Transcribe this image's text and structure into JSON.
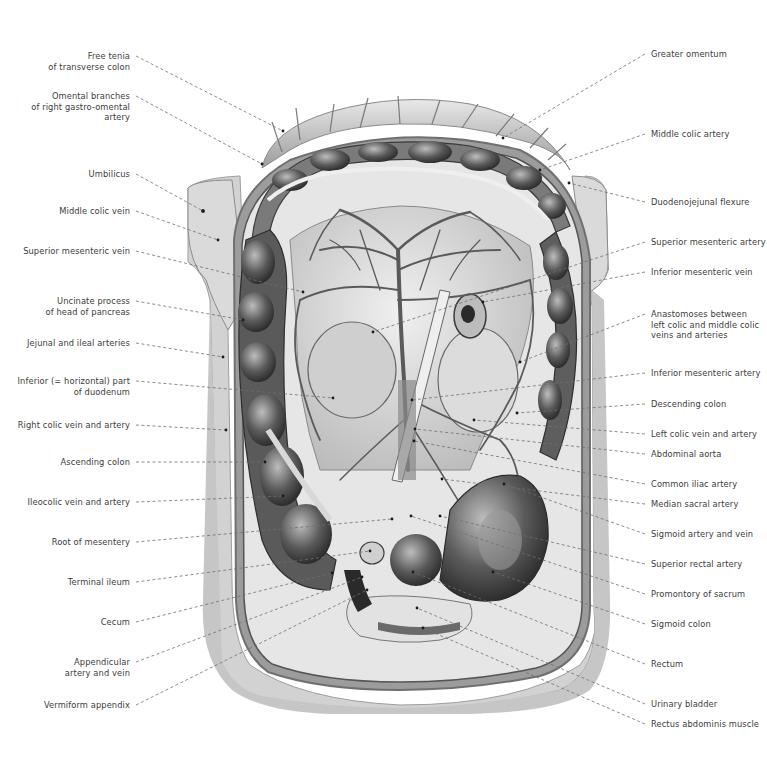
{
  "figure": {
    "colors": {
      "background": "#ffffff",
      "skin": "#c9c9c9",
      "skin_dark": "#a9a9a9",
      "tissue_light": "#dcdcdc",
      "tissue_mid": "#8c8c8c",
      "tissue_dark": "#3d3d3d",
      "leader_line": "#6e6e6e",
      "label_text": "#3c3c3c"
    }
  },
  "labels_left": [
    {
      "id": "free-tenia",
      "text": "Free tenia\nof transverse colon",
      "x": 130,
      "y": 56,
      "target": [
        283,
        131
      ]
    },
    {
      "id": "omental-branches",
      "text": "Omental branches\nof right gastro-omental\nartery",
      "x": 130,
      "y": 96,
      "target": [
        262,
        164
      ]
    },
    {
      "id": "umbilicus",
      "text": "Umbilicus",
      "x": 130,
      "y": 174,
      "target": [
        203,
        211
      ]
    },
    {
      "id": "middle-colic-vein",
      "text": "Middle colic vein",
      "x": 130,
      "y": 211,
      "target": [
        218,
        240
      ]
    },
    {
      "id": "superior-mesenteric-vein",
      "text": "Superior mesenteric vein",
      "x": 130,
      "y": 251,
      "target": [
        303,
        292
      ]
    },
    {
      "id": "uncinate-process",
      "text": "Uncinate process\nof head of pancreas",
      "x": 130,
      "y": 301,
      "target": [
        243,
        320
      ]
    },
    {
      "id": "jejunal-ileal-arteries",
      "text": "Jejunal and ileal arteries",
      "x": 130,
      "y": 343,
      "target": [
        223,
        357
      ]
    },
    {
      "id": "inferior-duodenum",
      "text": "Inferior (= horizontal) part\nof duodenum",
      "x": 130,
      "y": 381,
      "target": [
        333,
        398
      ]
    },
    {
      "id": "right-colic",
      "text": "Right colic vein and artery",
      "x": 130,
      "y": 425,
      "target": [
        226,
        430
      ]
    },
    {
      "id": "ascending-colon",
      "text": "Ascending colon",
      "x": 130,
      "y": 462,
      "target": [
        265,
        462
      ]
    },
    {
      "id": "ileocolic",
      "text": "Ileocolic vein and artery",
      "x": 130,
      "y": 502,
      "target": [
        283,
        496
      ]
    },
    {
      "id": "root-of-mesentery",
      "text": "Root of mesentery",
      "x": 130,
      "y": 542,
      "target": [
        392,
        519
      ]
    },
    {
      "id": "terminal-ileum",
      "text": "Terminal ileum",
      "x": 130,
      "y": 582,
      "target": [
        370,
        551
      ]
    },
    {
      "id": "cecum",
      "text": "Cecum",
      "x": 130,
      "y": 622,
      "target": [
        332,
        573
      ]
    },
    {
      "id": "appendicular",
      "text": "Appendicular\nartery and vein",
      "x": 130,
      "y": 662,
      "target": [
        362,
        577
      ]
    },
    {
      "id": "vermiform-appendix",
      "text": "Vermiform appendix",
      "x": 130,
      "y": 705,
      "target": [
        367,
        590
      ]
    }
  ],
  "labels_right": [
    {
      "id": "greater-omentum",
      "text": "Greater omentum",
      "x": 651,
      "y": 54,
      "target": [
        503,
        138
      ]
    },
    {
      "id": "middle-colic-artery",
      "text": "Middle colic artery",
      "x": 651,
      "y": 134,
      "target": [
        540,
        170
      ]
    },
    {
      "id": "duodenojejunal-flexure",
      "text": "Duodenojejunal flexure",
      "x": 651,
      "y": 202,
      "target": [
        569,
        183
      ]
    },
    {
      "id": "superior-mesenteric-artery",
      "text": "Superior mesenteric artery",
      "x": 651,
      "y": 242,
      "target": [
        373,
        332
      ]
    },
    {
      "id": "inferior-mesenteric-vein",
      "text": "Inferior mesenteric vein",
      "x": 651,
      "y": 272,
      "target": [
        483,
        302
      ]
    },
    {
      "id": "anastomoses",
      "text": "Anastomoses between\nleft colic and middle colic\nveins and arteries",
      "x": 651,
      "y": 314,
      "target": [
        520,
        362
      ]
    },
    {
      "id": "inferior-mesenteric-artery",
      "text": "Inferior mesenteric artery",
      "x": 651,
      "y": 373,
      "target": [
        412,
        400
      ]
    },
    {
      "id": "descending-colon",
      "text": "Descending colon",
      "x": 651,
      "y": 404,
      "target": [
        517,
        413
      ]
    },
    {
      "id": "left-colic",
      "text": "Left colic vein and artery",
      "x": 651,
      "y": 434,
      "target": [
        474,
        420
      ]
    },
    {
      "id": "abdominal-aorta",
      "text": "Abdominal aorta",
      "x": 651,
      "y": 454,
      "target": [
        415,
        429
      ]
    },
    {
      "id": "common-iliac-artery",
      "text": "Common iliac artery",
      "x": 651,
      "y": 484,
      "target": [
        414,
        441
      ]
    },
    {
      "id": "median-sacral-artery",
      "text": "Median sacral artery",
      "x": 651,
      "y": 504,
      "target": [
        442,
        479
      ]
    },
    {
      "id": "sigmoid-artery-vein",
      "text": "Sigmoid artery and vein",
      "x": 651,
      "y": 534,
      "target": [
        504,
        484
      ]
    },
    {
      "id": "superior-rectal-artery",
      "text": "Superior rectal artery",
      "x": 651,
      "y": 564,
      "target": [
        440,
        516
      ]
    },
    {
      "id": "promontory-of-sacrum",
      "text": "Promontory of sacrum",
      "x": 651,
      "y": 594,
      "target": [
        411,
        516
      ]
    },
    {
      "id": "sigmoid-colon",
      "text": "Sigmoid colon",
      "x": 651,
      "y": 624,
      "target": [
        493,
        572
      ]
    },
    {
      "id": "rectum",
      "text": "Rectum",
      "x": 651,
      "y": 664,
      "target": [
        413,
        572
      ]
    },
    {
      "id": "urinary-bladder",
      "text": "Urinary bladder",
      "x": 651,
      "y": 704,
      "target": [
        417,
        608
      ]
    },
    {
      "id": "rectus-abdominis",
      "text": "Rectus abdominis muscle",
      "x": 651,
      "y": 724,
      "target": [
        423,
        628
      ]
    }
  ]
}
